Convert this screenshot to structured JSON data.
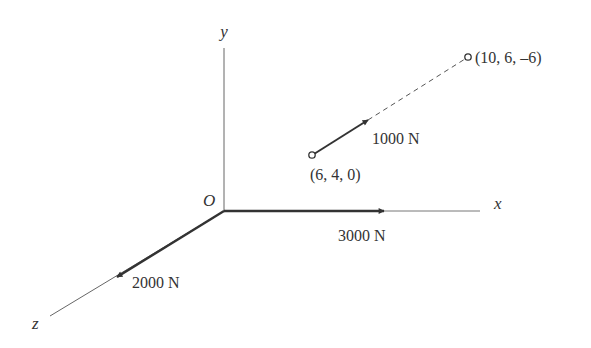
{
  "diagram": {
    "axes": {
      "x_label": "x",
      "y_label": "y",
      "z_label": "z",
      "origin_label": "O"
    },
    "forces": [
      {
        "label": "3000 N",
        "direction": "+x"
      },
      {
        "label": "2000 N",
        "direction": "+z"
      },
      {
        "label": "1000 N",
        "from": "(6, 4, 0)",
        "toward": "(10, 6, –6)"
      }
    ],
    "points": [
      {
        "label": "(6, 4, 0)"
      },
      {
        "label": "(10, 6, –6)"
      }
    ],
    "colors": {
      "line": "#555555",
      "arrow": "#333333",
      "text": "#333333"
    }
  }
}
